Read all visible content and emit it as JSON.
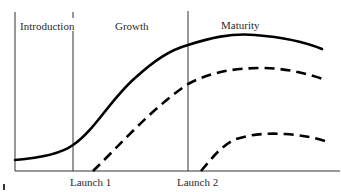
{
  "diagram": {
    "phases": [
      {
        "label": "Introduction"
      },
      {
        "label": "Growth"
      },
      {
        "label": "Maturity"
      }
    ],
    "markers": [
      {
        "label": "Launch 1"
      },
      {
        "label": "Launch 2"
      }
    ],
    "curves": [
      {
        "name": "overall-sales",
        "style": "solid",
        "color": "#000000"
      },
      {
        "name": "product-1-sales",
        "style": "dashed",
        "color": "#000000"
      },
      {
        "name": "product-2-sales",
        "style": "dashed",
        "color": "#000000"
      }
    ],
    "colors": {
      "line": "#000000",
      "axis": "#333333",
      "text": "#2a2a2a",
      "background": "#ffffff"
    }
  }
}
